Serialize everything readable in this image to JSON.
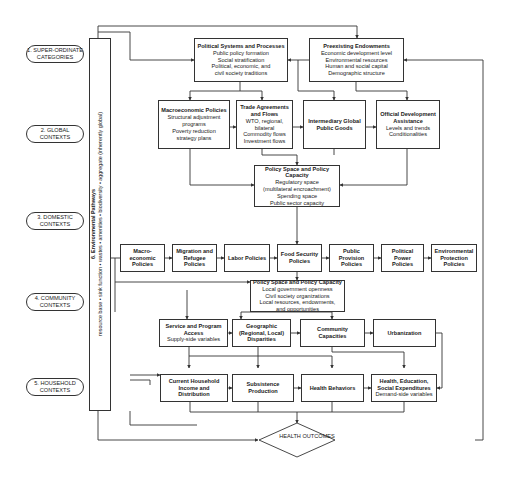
{
  "levels": [
    {
      "label": "1. SUPER-ORDINATE CATEGORIES"
    },
    {
      "label": "2. GLOBAL CONTEXTS"
    },
    {
      "label": "3. DOMESTIC CONTEXTS"
    },
    {
      "label": "4. COMMUNITY CONTEXTS"
    },
    {
      "label": "5. HOUSEHOLD CONTEXTS"
    }
  ],
  "environmental": {
    "title": "6. Environmental Pathways",
    "line": "resource base  •  sink function  •  wastes  •  amenities  •  biodiversity  •  aggregate (inherently global)"
  },
  "superordinate": {
    "political": {
      "title": "Political Systems and Processes",
      "lines": [
        "Public policy formation",
        "Social stratification",
        "Political, economic, and",
        "civil society traditions"
      ]
    },
    "endowments": {
      "title": "Preexisting Endowments",
      "lines": [
        "Economic development level",
        "Environmental resources",
        "Human and social capital",
        "Demographic structure"
      ]
    }
  },
  "global": {
    "macro": {
      "title": "Macroeconomic Policies",
      "lines": [
        "Structural adjustment",
        "programs",
        "Poverty reduction",
        "strategy plans"
      ]
    },
    "trade": {
      "title": "Trade Agreements and Flows",
      "lines": [
        "WTO, regional,",
        "bilateral",
        "Commodity flows",
        "Investment flows"
      ]
    },
    "goods": {
      "title": "Intermediary Global Public Goods"
    },
    "oda": {
      "title": "Official Development Assistance",
      "lines": [
        "Levels and trends",
        "Conditionalities"
      ]
    }
  },
  "national_capacity": {
    "title": "Policy Space and Policy Capacity",
    "lines": [
      "Regulatory space",
      "(multilateral encroachment)",
      "Spending space",
      "Public sector capacity"
    ]
  },
  "domestic": [
    {
      "title": "Macro-economic Policies"
    },
    {
      "title": "Migration and Refugee Policies"
    },
    {
      "title": "Labor Policies"
    },
    {
      "title": "Food Security Policies"
    },
    {
      "title": "Public Provision Policies"
    },
    {
      "title": "Political Power Policies"
    },
    {
      "title": "Environmental Protection Policies"
    }
  ],
  "local_capacity": {
    "title": "Policy Space and Policy Capacity",
    "lines": [
      "Local government openness",
      "Civil society organizations",
      "Local resources, endowments,",
      "and opportunities"
    ]
  },
  "community": {
    "service": {
      "title": "Service and Program Access",
      "lines": [
        "Supply-side variables"
      ]
    },
    "geographic": {
      "title": "Geographic (Regional, Local) Disparities"
    },
    "capacities": {
      "title": "Community Capacities"
    },
    "urbanization": {
      "title": "Urbanization"
    }
  },
  "household": {
    "income": {
      "title": "Current Household Income and Distribution"
    },
    "subsistence": {
      "title": "Subsistence Production"
    },
    "behaviors": {
      "title": "Health Behaviors"
    },
    "expenditures": {
      "title": "Health, Education, Social Expenditures",
      "lines": [
        "Demand-side variables"
      ]
    }
  },
  "outcome": {
    "label": "HEALTH OUTCOMES"
  }
}
